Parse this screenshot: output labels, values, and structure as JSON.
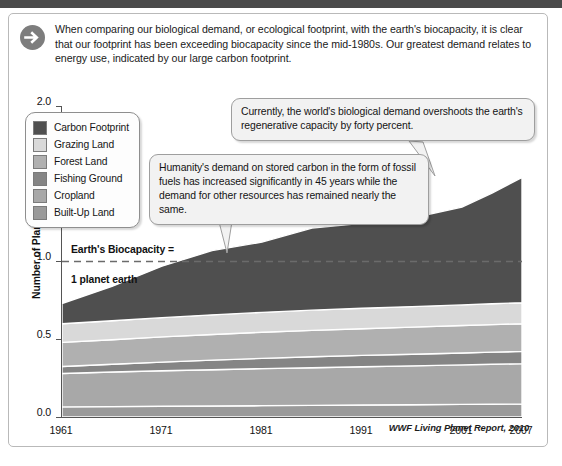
{
  "intro": {
    "icon": "arrow-right-circle-icon",
    "text": "When comparing our biological demand, or ecological footprint, with the earth's biocapacity, it is clear that our footprint has been exceeding biocapacity since the mid-1980s. Our greatest demand relates to energy use, indicated by our large carbon footprint."
  },
  "callouts": [
    {
      "id": "callout-1",
      "text": "Currently, the world's biological demand overshoots the earth's regenerative capacity by forty percent."
    },
    {
      "id": "callout-2",
      "text": "Humanity's demand on stored carbon in the form of fossil fuels has increased significantly in 45 years while the demand for other resources has remained nearly the same."
    }
  ],
  "annotation": {
    "line1": "Earth's Biocapacity =",
    "line2": "1 planet earth"
  },
  "source": "WWF Living Planet Report, 2010",
  "chart_data": {
    "type": "area",
    "stacked": true,
    "title": "",
    "xlabel": "",
    "ylabel": "Number of Planet Earths",
    "xlim": [
      1961,
      2007
    ],
    "ylim": [
      0.0,
      2.0
    ],
    "yticks": [
      "0.0",
      "0.5",
      "1.0",
      "1.5",
      "2.0"
    ],
    "xticks": [
      "1961",
      "1971",
      "1981",
      "1991",
      "2001",
      "2007"
    ],
    "grid": false,
    "legend_position": "top-left",
    "reference_line": {
      "value": 1.0,
      "label": "Earth's Biocapacity = 1 planet earth",
      "style": "dashed"
    },
    "x": [
      1961,
      1966,
      1971,
      1976,
      1981,
      1986,
      1991,
      1996,
      2001,
      2004,
      2007
    ],
    "series": [
      {
        "name": "Built-Up Land",
        "color": "#9a9a9a",
        "values": [
          0.065,
          0.067,
          0.069,
          0.071,
          0.073,
          0.075,
          0.077,
          0.079,
          0.081,
          0.082,
          0.083
        ]
      },
      {
        "name": "Cropland",
        "color": "#a8a8a8",
        "values": [
          0.215,
          0.222,
          0.228,
          0.233,
          0.238,
          0.242,
          0.246,
          0.25,
          0.254,
          0.257,
          0.26
        ]
      },
      {
        "name": "Fishing Ground",
        "color": "#858585",
        "values": [
          0.045,
          0.05,
          0.056,
          0.062,
          0.066,
          0.07,
          0.073,
          0.075,
          0.077,
          0.078,
          0.079
        ]
      },
      {
        "name": "Forest Land",
        "color": "#b0b0b0",
        "values": [
          0.155,
          0.158,
          0.162,
          0.165,
          0.168,
          0.17,
          0.172,
          0.174,
          0.176,
          0.177,
          0.178
        ]
      },
      {
        "name": "Grazing Land",
        "color": "#d9d9d9",
        "values": [
          0.12,
          0.122,
          0.124,
          0.126,
          0.128,
          0.13,
          0.131,
          0.132,
          0.133,
          0.134,
          0.135
        ]
      },
      {
        "name": "Carbon Footprint",
        "color": "#4f4f4f",
        "values": [
          0.13,
          0.221,
          0.331,
          0.413,
          0.452,
          0.528,
          0.546,
          0.57,
          0.629,
          0.712,
          0.805
        ]
      }
    ],
    "totals": [
      0.73,
      0.84,
      0.97,
      1.07,
      1.13,
      1.22,
      1.25,
      1.28,
      1.35,
      1.44,
      1.54
    ],
    "legend_order": [
      "Carbon Footprint",
      "Grazing Land",
      "Forest Land",
      "Fishing Ground",
      "Cropland",
      "Built-Up Land"
    ]
  }
}
